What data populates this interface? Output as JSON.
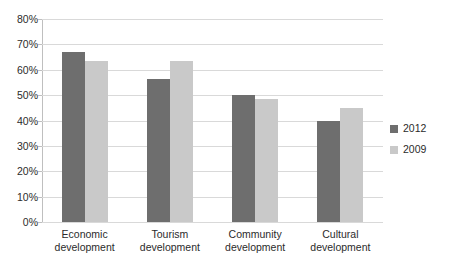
{
  "chart_data": {
    "type": "bar",
    "title": "",
    "subtitle": "",
    "xlabel": "",
    "ylabel": "",
    "categories": [
      "Economic development",
      "Tourism development",
      "Community development",
      "Cultural development"
    ],
    "category_lines": [
      [
        "Economic",
        "development"
      ],
      [
        "Tourism",
        "development"
      ],
      [
        "Community",
        "development"
      ],
      [
        "Cultural",
        "development"
      ]
    ],
    "series": [
      {
        "name": "2012",
        "color": "#6e6e6e",
        "values": [
          67,
          56.5,
          50,
          40
        ]
      },
      {
        "name": "2009",
        "color": "#c9c9c9",
        "values": [
          63.5,
          63.5,
          48.5,
          45
        ]
      }
    ],
    "ylim": [
      0,
      80
    ],
    "ytick_values": [
      80,
      70,
      60,
      50,
      40,
      30,
      20,
      10,
      0
    ],
    "ytick_labels": [
      "80%",
      "70%",
      "60%",
      "50%",
      "40%",
      "30%",
      "20%",
      "10%",
      "0%"
    ],
    "grid": true,
    "legend_position": "right",
    "grid_color": "#d9d9d9",
    "axis_color": "#bfbfbf",
    "text_color": "#2b2b2b",
    "background": "#ffffff"
  }
}
